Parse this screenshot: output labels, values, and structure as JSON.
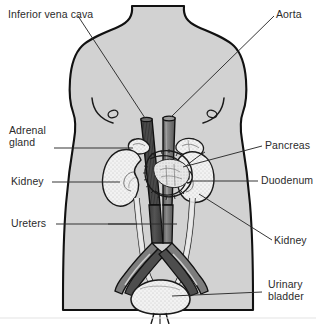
{
  "figure": {
    "background_color": "#ffffff",
    "body_fill": "#d2d2d2",
    "outline_color": "#111111",
    "text_color": "#2b2b2b"
  },
  "labels": {
    "inferior_vena_cava": "Inferior vena cava",
    "aorta": "Aorta",
    "adrenal_gland": "Adrenal\ngland",
    "kidney_left": "Kidney",
    "ureters": "Ureters",
    "pancreas": "Pancreas",
    "duodenum": "Duodenum",
    "kidney_right": "Kidney",
    "urinary_bladder": "Urinary\nbladder"
  },
  "structures": {
    "inferior_vena_cava": {
      "name": "inferior-vena-cava",
      "color": "#4a4a4a"
    },
    "aorta": {
      "name": "aorta",
      "color": "#6e6e6e"
    },
    "adrenal_gland": {
      "name": "adrenal-gland",
      "color": "#f5f5f5"
    },
    "kidney": {
      "name": "kidney",
      "color": "#f2f2f2"
    },
    "pancreas": {
      "name": "pancreas",
      "color": "#f4f4f4"
    },
    "duodenum": {
      "name": "duodenum",
      "color": "#efefef"
    },
    "ureter": {
      "name": "ureter",
      "color": "#f0f0f0"
    },
    "urinary_bladder": {
      "name": "urinary-bladder",
      "color": "#dcdcdc"
    },
    "torso": {
      "name": "torso",
      "color": "#d2d2d2"
    }
  }
}
